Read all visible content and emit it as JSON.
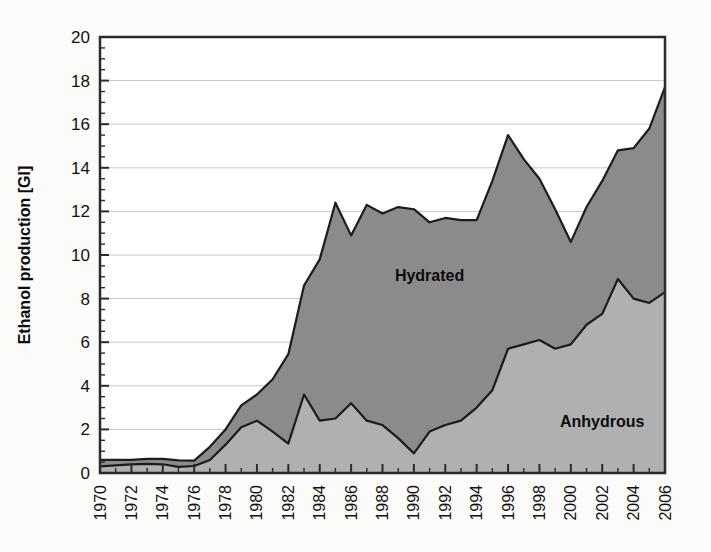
{
  "chart_data": {
    "type": "area",
    "stacked": true,
    "title": "",
    "xlabel": "",
    "ylabel": "Ethanol production [Gl]",
    "xlim": [
      1970,
      2006
    ],
    "ylim": [
      0,
      20
    ],
    "ytick_step": 2,
    "yticks": [
      0,
      2,
      4,
      6,
      8,
      10,
      12,
      14,
      16,
      18,
      20
    ],
    "ytick_labels": [
      "0",
      "2",
      "4",
      "6",
      "8",
      "10",
      "12",
      "14",
      "16",
      "18",
      "20"
    ],
    "xticks": [
      1970,
      1972,
      1974,
      1976,
      1978,
      1980,
      1982,
      1984,
      1986,
      1988,
      1990,
      1992,
      1994,
      1996,
      1998,
      2000,
      2002,
      2004,
      2006
    ],
    "xtick_labels": [
      "1970",
      "1972",
      "1974",
      "1976",
      "1978",
      "1980",
      "1982",
      "1984",
      "1986",
      "1988",
      "1990",
      "1992",
      "1994",
      "1996",
      "1998",
      "2000",
      "2002",
      "2004",
      "2006"
    ],
    "xtick_rotation": 90,
    "minor_xticks_every": 1,
    "grid": "horizontal",
    "legend_position": "inline-annotations",
    "x": [
      1970,
      1971,
      1972,
      1973,
      1974,
      1975,
      1976,
      1977,
      1978,
      1979,
      1980,
      1981,
      1982,
      1983,
      1984,
      1985,
      1986,
      1987,
      1988,
      1989,
      1990,
      1991,
      1992,
      1993,
      1994,
      1995,
      1996,
      1997,
      1998,
      1999,
      2000,
      2001,
      2002,
      2003,
      2004,
      2005,
      2006
    ],
    "series": [
      {
        "name": "Anhydrous",
        "fill_color": "#b0b0b0",
        "label_x": 2002,
        "label_y": 2.1,
        "values": [
          0.3,
          0.35,
          0.4,
          0.42,
          0.4,
          0.28,
          0.32,
          0.6,
          1.3,
          2.1,
          2.4,
          1.9,
          1.35,
          3.6,
          2.4,
          2.5,
          3.2,
          2.4,
          2.2,
          1.6,
          0.9,
          1.9,
          2.2,
          2.4,
          3.0,
          3.8,
          5.7,
          5.9,
          6.1,
          5.7,
          5.9,
          6.8,
          7.3,
          8.9,
          8.0,
          7.8,
          8.3
        ]
      },
      {
        "name": "Hydrated",
        "fill_color": "#8b8b8b",
        "label_x": 1991,
        "label_y": 8.8,
        "values": [
          0.3,
          0.25,
          0.2,
          0.23,
          0.25,
          0.3,
          0.25,
          0.6,
          0.7,
          1.0,
          1.2,
          2.4,
          4.1,
          5.0,
          7.4,
          9.9,
          7.7,
          9.9,
          9.7,
          10.6,
          11.2,
          9.6,
          9.5,
          9.2,
          8.6,
          9.6,
          9.8,
          8.5,
          7.4,
          6.4,
          4.7,
          5.4,
          6.1,
          5.9,
          6.9,
          8.0,
          9.4
        ]
      }
    ],
    "totals": [
      0.6,
      0.6,
      0.6,
      0.65,
      0.65,
      0.58,
      0.57,
      1.2,
      2.0,
      3.1,
      3.6,
      4.3,
      5.45,
      8.6,
      9.8,
      12.4,
      10.9,
      12.3,
      11.9,
      12.2,
      12.1,
      11.5,
      11.7,
      11.6,
      11.6,
      13.4,
      15.5,
      14.4,
      13.5,
      12.1,
      10.6,
      12.2,
      13.4,
      14.8,
      14.9,
      15.8,
      17.7
    ]
  }
}
